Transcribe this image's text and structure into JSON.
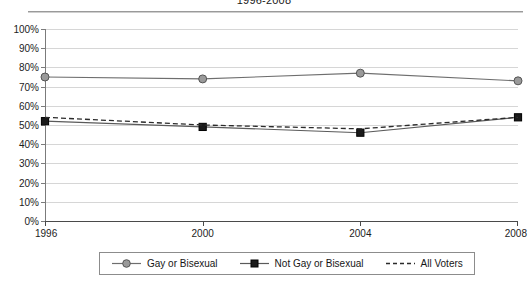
{
  "chart": {
    "title": "1996-2008",
    "ylabel": "",
    "xlabel": ""
  },
  "legend": {
    "items": [
      {
        "label": "Gay or Bisexual",
        "marker": "circle-marker",
        "style": "solid"
      },
      {
        "label": "Not Gay or Bisexual",
        "marker": "square-marker",
        "style": "solid"
      },
      {
        "label": "All Voters",
        "marker": "none",
        "style": "dashed"
      }
    ]
  },
  "axes": {
    "y_ticks": [
      "100%",
      "90%",
      "80%",
      "70%",
      "60%",
      "50%",
      "40%",
      "30%",
      "20%",
      "10%",
      "0%"
    ],
    "x_ticks": [
      "1996",
      "2000",
      "2004",
      "2008"
    ]
  },
  "colors": {
    "gay_or_bisexual_line": "#6e6e6e",
    "gay_or_bisexual_marker": "#9a9a9a",
    "not_gay_or_bisexual_line": "#5a5a5a",
    "not_gay_or_bisexual_marker": "#1a1a1a",
    "all_voters_line": "#2b2b2b",
    "gridline": "#d6d6d6",
    "axis": "#4a4a4a"
  },
  "chart_data": {
    "type": "line",
    "title": "1996-2008",
    "xlabel": "",
    "ylabel": "",
    "categories": [
      "1996",
      "2000",
      "2004",
      "2008"
    ],
    "x": [
      1996,
      2000,
      2004,
      2008
    ],
    "ylim": [
      0,
      100
    ],
    "yticks": [
      0,
      10,
      20,
      30,
      40,
      50,
      60,
      70,
      80,
      90,
      100
    ],
    "ytick_format": "percent",
    "grid": true,
    "legend_position": "bottom",
    "series": [
      {
        "name": "Gay or Bisexual",
        "values": [
          75,
          74,
          77,
          73
        ],
        "marker": "circle",
        "linestyle": "solid"
      },
      {
        "name": "Not Gay or Bisexual",
        "values": [
          52,
          49,
          46,
          54
        ],
        "marker": "square",
        "linestyle": "solid"
      },
      {
        "name": "All Voters",
        "values": [
          54,
          50,
          48,
          54
        ],
        "marker": "none",
        "linestyle": "dashed"
      }
    ]
  }
}
